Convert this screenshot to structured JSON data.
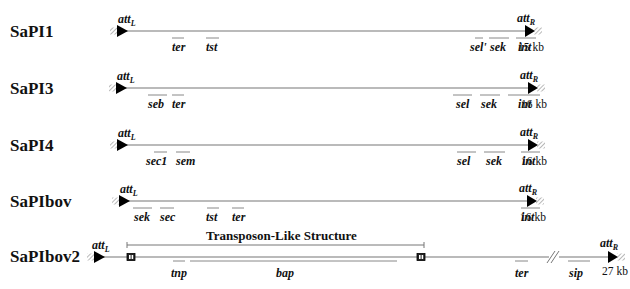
{
  "figure": {
    "colors": {
      "line": "#777777",
      "text": "#111111",
      "arrow": "#000000",
      "hatch": "#888888"
    },
    "islands": [
      {
        "name": "SaPI1",
        "y": 31,
        "start_x": 118,
        "end_x": 527,
        "attL": "att",
        "attL_sub": "L",
        "attR": "att",
        "attR_sub": "R",
        "size": "15 kb",
        "genes": [
          {
            "label": "ter",
            "x1": 172,
            "x2": 184,
            "lx": 172
          },
          {
            "label": "tst",
            "x1": 206,
            "x2": 219,
            "lx": 206
          },
          {
            "label": "sel'",
            "x1": 475,
            "x2": 483,
            "lx": 470
          },
          {
            "label": "sek",
            "x1": 489,
            "x2": 509,
            "lx": 490
          },
          {
            "label": "int",
            "x1": 516,
            "x2": 536,
            "lx": 518
          }
        ]
      },
      {
        "name": "SaPI3",
        "y": 88,
        "start_x": 117,
        "end_x": 530,
        "attL": "att",
        "attL_sub": "L",
        "attR": "att",
        "attR_sub": "R",
        "size": "16 kb",
        "genes": [
          {
            "label": "seb",
            "x1": 148,
            "x2": 167,
            "lx": 148
          },
          {
            "label": "ter",
            "x1": 172,
            "x2": 184,
            "lx": 172
          },
          {
            "label": "sel",
            "x1": 453,
            "x2": 472,
            "lx": 456
          },
          {
            "label": "sek",
            "x1": 480,
            "x2": 500,
            "lx": 481
          },
          {
            "label": "int",
            "x1": 508,
            "x2": 540,
            "lx": 518
          }
        ]
      },
      {
        "name": "SaPI4",
        "y": 145,
        "start_x": 118,
        "end_x": 530,
        "attL": "att",
        "attL_sub": "L",
        "attR": "att",
        "attR_sub": "R",
        "size": "16 kb",
        "genes": [
          {
            "label": "sec1",
            "x1": 154,
            "x2": 167,
            "lx": 146
          },
          {
            "label": "sem",
            "x1": 176,
            "x2": 190,
            "lx": 176
          },
          {
            "label": "sel",
            "x1": 457,
            "x2": 476,
            "lx": 457
          },
          {
            "label": "sek",
            "x1": 484,
            "x2": 505,
            "lx": 486
          },
          {
            "label": "int",
            "x1": 521,
            "x2": 540,
            "lx": 522
          }
        ]
      },
      {
        "name": "SaPIbov",
        "y": 201,
        "start_x": 120,
        "end_x": 529,
        "attL": "att",
        "attL_sub": "L",
        "attR": "att",
        "attR_sub": "R",
        "size": "16 kb",
        "genes": [
          {
            "label": "sek",
            "x1": 133,
            "x2": 152,
            "lx": 134
          },
          {
            "label": "sec",
            "x1": 160,
            "x2": 174,
            "lx": 160
          },
          {
            "label": "tst",
            "x1": 207,
            "x2": 219,
            "lx": 206
          },
          {
            "label": "ter",
            "x1": 232,
            "x2": 244,
            "lx": 232
          },
          {
            "label": "int",
            "x1": 521,
            "x2": 540,
            "lx": 521
          }
        ]
      }
    ],
    "sapibov2": {
      "name": "SaPIbov2",
      "y": 257,
      "start_x": 95,
      "end_x": 610,
      "attL": "att",
      "attL_sub": "L",
      "attR": "att",
      "attR_sub": "R",
      "size": "27 kb",
      "transposon_label": "Transposon-Like Structure",
      "transposon_x1": 127,
      "transposon_x2": 424,
      "break_x": 553,
      "genes": [
        {
          "label": "tnp",
          "x1": 173,
          "x2": 185,
          "lx": 171
        },
        {
          "label": "bap",
          "x1": 190,
          "x2": 397,
          "lx": 276
        },
        {
          "label": "ter",
          "x1": 515,
          "x2": 528,
          "lx": 515
        },
        {
          "label": "sip",
          "x1": 568,
          "x2": 590,
          "lx": 569
        }
      ]
    }
  }
}
